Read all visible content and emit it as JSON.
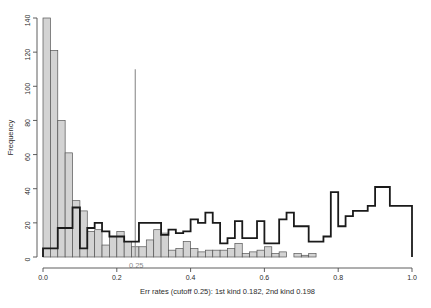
{
  "chart_data": {
    "type": "bar",
    "title": "",
    "subtitle": "",
    "xlabel": "Err rates (cutoff 0.25): 1st kind 0.182, 2nd kind 0.198",
    "ylabel": "Frequency",
    "xlim": [
      0.0,
      1.0
    ],
    "ylim": [
      0,
      140
    ],
    "grid": false,
    "legend_position": "none",
    "xticks": [
      0.0,
      0.2,
      0.4,
      0.6,
      0.8,
      1.0
    ],
    "xticklabels": [
      "0.0",
      "0.2",
      "0.4",
      "0.6",
      "0.8",
      "1.0"
    ],
    "yticks": [
      0,
      20,
      40,
      60,
      80,
      100,
      120,
      140
    ],
    "yticklabels": [
      "0",
      "20",
      "40",
      "60",
      "80",
      "100",
      "120",
      "140"
    ],
    "bin_width": 0.02,
    "bin_edges": [
      0.0,
      0.02,
      0.04,
      0.06,
      0.08,
      0.1,
      0.12,
      0.14,
      0.16,
      0.18,
      0.2,
      0.22,
      0.24,
      0.26,
      0.28,
      0.3,
      0.32,
      0.34,
      0.36,
      0.38,
      0.4,
      0.42,
      0.44,
      0.46,
      0.48,
      0.5,
      0.52,
      0.54,
      0.56,
      0.58,
      0.6,
      0.62,
      0.64,
      0.66,
      0.68,
      0.7,
      0.72,
      0.74,
      0.76,
      0.78,
      0.8,
      0.82,
      0.84,
      0.86,
      0.88,
      0.9,
      0.92,
      0.94,
      0.96,
      0.98,
      1.0
    ],
    "series": [
      {
        "name": "null-distribution",
        "style": "filled",
        "fill_color": "#d3d3d3",
        "edge_color": "#555555",
        "values": [
          140,
          121,
          80,
          61,
          33,
          27,
          15,
          16,
          7,
          12,
          15,
          9,
          6,
          6,
          10,
          16,
          14,
          4,
          5,
          9,
          5,
          3,
          4,
          4,
          4,
          5,
          8,
          2,
          3,
          4,
          6,
          2,
          3,
          0,
          2,
          1,
          2,
          0,
          0,
          0,
          0,
          0,
          0,
          0,
          0,
          0,
          0,
          0,
          0,
          0
        ]
      },
      {
        "name": "alternative-distribution",
        "style": "outline",
        "fill_color": "none",
        "edge_color": "#1a1a1a",
        "values": [
          5,
          5,
          17,
          17,
          29,
          5,
          17,
          20,
          15,
          12,
          12,
          9,
          9,
          20,
          20,
          20,
          13,
          16,
          14,
          15,
          22,
          20,
          26,
          20,
          8,
          11,
          21,
          11,
          11,
          21,
          8,
          8,
          22,
          26,
          18,
          18,
          9,
          9,
          12,
          38,
          18,
          24,
          27,
          27,
          30,
          41,
          41,
          30,
          30,
          30
        ]
      }
    ],
    "cutoff": {
      "value": 0.25,
      "label": "0.25",
      "line_color": "#8c8c8c",
      "line_top_frequency": 110
    },
    "error_rates": {
      "first_kind": 0.182,
      "second_kind": 0.198
    }
  },
  "axes": {
    "y_axis_title": "Frequency",
    "x_axis_title": "Err rates (cutoff 0.25): 1st kind 0.182, 2nd kind 0.198"
  }
}
